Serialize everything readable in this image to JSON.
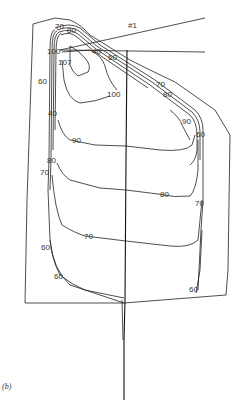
{
  "figure": {
    "caption": "(b)",
    "ray_label": "#1",
    "contour_labels": {
      "top_70": "70",
      "top_80": "80",
      "left_100": "100",
      "center_40": "40",
      "upper_60": "60",
      "inner_107": "107",
      "left_60": "60",
      "right_70": "70",
      "right_80": "80",
      "inner_100": "100",
      "left_40": "40",
      "right_90": "90",
      "right_60": "60",
      "mid_90": "90",
      "left_80": "80",
      "left_70": "70",
      "mid_80": "80",
      "right_mid_70": "70",
      "mid_70": "70",
      "lower_left_60": "60",
      "bottom_left_60": "60",
      "bottom_right_60": "60"
    }
  }
}
